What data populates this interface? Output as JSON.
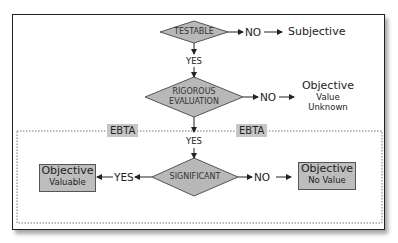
{
  "diagram": {
    "nodes": {
      "testable": {
        "label": "TESTABLE"
      },
      "rigorous": {
        "line1": "RIGOROUS",
        "line2": "EVALUATION"
      },
      "significant": {
        "label": "SIGNIFICANT"
      }
    },
    "edges": {
      "testable_no": "NO",
      "testable_yes": "YES",
      "rigorous_no": "NO",
      "rigorous_yes": "YES",
      "significant_yes": "YES",
      "significant_no": "NO"
    },
    "outcomes": {
      "subjective": {
        "label": "Subjective"
      },
      "value_unknown": {
        "line1": "Objective",
        "line2": "Value",
        "line3": "Unknown"
      },
      "valuable": {
        "line1": "Objective",
        "line2": "Valuable"
      },
      "no_value": {
        "line1": "Objective",
        "line2": "No Value"
      }
    },
    "region": {
      "label_left": "EBTA",
      "label_right": "EBTA"
    },
    "colors": {
      "diamond_fill": "#b8b8b8",
      "box_fill": "#bdbdbd",
      "stroke": "#222222"
    }
  }
}
